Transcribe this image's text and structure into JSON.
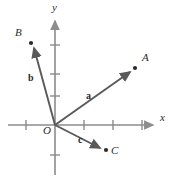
{
  "figure": {
    "background_color": "#ffffff",
    "axis_color": "#8c8c8c",
    "vector_color": "#595959",
    "text_color": "#2b2b2b",
    "width": 172,
    "height": 183
  },
  "axes": {
    "x_axis": {
      "name": "x-axis",
      "label": "x",
      "line": {
        "x1": 8,
        "y1": 125,
        "x2": 150,
        "y2": 125
      },
      "arrow_tip": {
        "x": 158,
        "y": 125
      },
      "label_pos": {
        "x": 160,
        "y": 118
      },
      "ticks": [
        {
          "x": 26,
          "value": -1
        },
        {
          "x": 84,
          "value": 1
        },
        {
          "x": 113,
          "value": 2
        },
        {
          "x": 142,
          "value": 3
        }
      ]
    },
    "y_axis": {
      "name": "y-axis",
      "label": "y",
      "line": {
        "x1": 55,
        "y1": 175,
        "x2": 55,
        "y2": 24
      },
      "arrow_tip": {
        "x": 55,
        "y": 16
      },
      "label_pos": {
        "x": 52,
        "y": 4
      },
      "ticks": [
        {
          "y": 45,
          "value": 3
        },
        {
          "y": 74,
          "value": 2
        },
        {
          "y": 96,
          "value": 1
        },
        {
          "y": 155,
          "value": -1
        }
      ]
    },
    "origin": {
      "label": "O",
      "x": 55,
      "y": 125,
      "label_pos": {
        "x": 44,
        "y": 128
      }
    },
    "tick_half_length": 5
  },
  "vectors": [
    {
      "name": "vector-a",
      "label": "a",
      "label_pos": {
        "x": 88,
        "y": 96
      },
      "start": {
        "x": 55,
        "y": 125
      },
      "end": {
        "x": 133,
        "y": 70
      },
      "endpoint_label": "A",
      "endpoint_label_pos": {
        "x": 143,
        "y": 58
      },
      "endpoint_dot": {
        "x": 135,
        "y": 68
      }
    },
    {
      "name": "vector-b",
      "label": "b",
      "label_pos": {
        "x": 30,
        "y": 78
      },
      "start": {
        "x": 55,
        "y": 125
      },
      "end": {
        "x": 33,
        "y": 45
      },
      "endpoint_label": "B",
      "endpoint_label_pos": {
        "x": 16,
        "y": 31
      },
      "endpoint_dot": {
        "x": 31,
        "y": 43
      }
    },
    {
      "name": "vector-c",
      "label": "c",
      "label_pos": {
        "x": 79,
        "y": 140
      },
      "start": {
        "x": 55,
        "y": 125
      },
      "end": {
        "x": 103,
        "y": 150
      },
      "endpoint_label": "C",
      "endpoint_label_pos": {
        "x": 112,
        "y": 150
      },
      "endpoint_dot": {
        "x": 106,
        "y": 150
      }
    }
  ]
}
